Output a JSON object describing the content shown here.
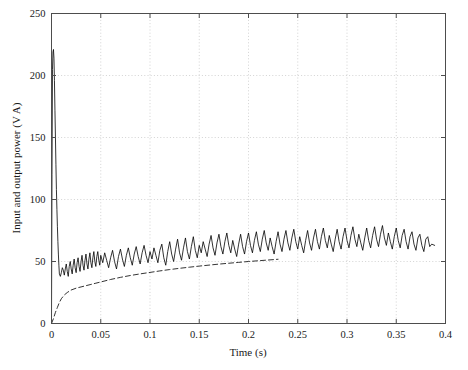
{
  "chart_data": {
    "type": "line",
    "title": "",
    "xlabel": "Time (s)",
    "ylabel": "Input and output power (V A)",
    "xlim": [
      0,
      0.4
    ],
    "ylim": [
      0,
      250
    ],
    "xticks": [
      0,
      0.05,
      0.1,
      0.15,
      0.2,
      0.25,
      0.3,
      0.35,
      0.4
    ],
    "xticklabels": [
      "0",
      "0.05",
      "0.1",
      "0.15",
      "0.2",
      "0.25",
      "0.3",
      "0.35",
      "0.4"
    ],
    "yticks": [
      0,
      50,
      100,
      150,
      200,
      250
    ],
    "yticklabels": [
      "0",
      "50",
      "100",
      "150",
      "200",
      "250"
    ],
    "grid": true,
    "grid_style": "dotted",
    "grid_color": "#c8c8c8",
    "legend": "none",
    "axis_color": "#4d4d4d",
    "background": "#ffffff",
    "series": [
      {
        "name": "Input power",
        "style": "solid",
        "color": "#000000",
        "linewidth": 0.8,
        "description": "Noisy input power: large startup spike to ~220 V A at t=0.002 s, collapses to ~38 V A by t=0.008 s, then noisy band slowly rising from mean ~47 to mean ~65 V A, noise half-amplitude about 8-12 V A, ends at t=0.389 s",
        "x": [
          0,
          0.0005,
          0.001,
          0.0015,
          0.002,
          0.0025,
          0.003,
          0.0035,
          0.004,
          0.0045,
          0.005,
          0.0055,
          0.006,
          0.0065,
          0.007,
          0.0075,
          0.008,
          0.009,
          0.01,
          0.011,
          0.012,
          0.013,
          0.014,
          0.015,
          0.016,
          0.017,
          0.018,
          0.019,
          0.02,
          0.021,
          0.022,
          0.023,
          0.024,
          0.025,
          0.026,
          0.027,
          0.028,
          0.029,
          0.03,
          0.031,
          0.032,
          0.033,
          0.034,
          0.035,
          0.036,
          0.037,
          0.038,
          0.039,
          0.04,
          0.041,
          0.042,
          0.043,
          0.044,
          0.045,
          0.046,
          0.047,
          0.048,
          0.049,
          0.05,
          0.052,
          0.054,
          0.056,
          0.058,
          0.06,
          0.062,
          0.064,
          0.066,
          0.068,
          0.07,
          0.072,
          0.074,
          0.076,
          0.078,
          0.08,
          0.082,
          0.084,
          0.086,
          0.088,
          0.09,
          0.092,
          0.094,
          0.096,
          0.098,
          0.1,
          0.102,
          0.104,
          0.106,
          0.108,
          0.11,
          0.112,
          0.114,
          0.116,
          0.118,
          0.12,
          0.122,
          0.124,
          0.126,
          0.128,
          0.13,
          0.132,
          0.134,
          0.136,
          0.138,
          0.14,
          0.142,
          0.144,
          0.146,
          0.148,
          0.15,
          0.152,
          0.154,
          0.156,
          0.158,
          0.16,
          0.162,
          0.164,
          0.166,
          0.168,
          0.17,
          0.172,
          0.174,
          0.176,
          0.178,
          0.18,
          0.182,
          0.184,
          0.186,
          0.188,
          0.19,
          0.192,
          0.194,
          0.196,
          0.198,
          0.2,
          0.202,
          0.204,
          0.206,
          0.208,
          0.21,
          0.212,
          0.214,
          0.216,
          0.218,
          0.22,
          0.222,
          0.224,
          0.226,
          0.228,
          0.23,
          0.232,
          0.234,
          0.236,
          0.238,
          0.24,
          0.242,
          0.244,
          0.246,
          0.248,
          0.25,
          0.252,
          0.254,
          0.256,
          0.258,
          0.26,
          0.262,
          0.264,
          0.266,
          0.268,
          0.27,
          0.272,
          0.274,
          0.276,
          0.278,
          0.28,
          0.282,
          0.284,
          0.286,
          0.288,
          0.29,
          0.292,
          0.294,
          0.296,
          0.298,
          0.3,
          0.302,
          0.304,
          0.306,
          0.308,
          0.31,
          0.312,
          0.314,
          0.316,
          0.318,
          0.32,
          0.322,
          0.324,
          0.326,
          0.328,
          0.33,
          0.332,
          0.334,
          0.336,
          0.338,
          0.34,
          0.342,
          0.344,
          0.346,
          0.348,
          0.35,
          0.352,
          0.354,
          0.356,
          0.358,
          0.36,
          0.362,
          0.364,
          0.366,
          0.368,
          0.37,
          0.372,
          0.374,
          0.376,
          0.378,
          0.38,
          0.382,
          0.384,
          0.386,
          0.389
        ],
        "y": [
          0,
          120,
          205,
          219,
          221,
          214,
          196,
          172,
          150,
          128,
          108,
          92,
          78,
          66,
          56,
          47,
          40,
          38,
          41,
          45,
          43,
          39,
          44,
          48,
          42,
          38,
          46,
          50,
          44,
          40,
          47,
          52,
          45,
          41,
          49,
          53,
          46,
          42,
          50,
          55,
          47,
          43,
          51,
          56,
          48,
          44,
          52,
          57,
          49,
          45,
          53,
          58,
          50,
          46,
          54,
          58,
          51,
          47,
          55,
          49,
          57,
          51,
          45,
          53,
          59,
          50,
          44,
          54,
          60,
          52,
          46,
          55,
          61,
          53,
          47,
          56,
          62,
          54,
          48,
          57,
          63,
          55,
          49,
          58,
          52,
          61,
          55,
          49,
          59,
          64,
          53,
          47,
          58,
          66,
          56,
          50,
          60,
          68,
          57,
          51,
          61,
          69,
          58,
          52,
          62,
          70,
          59,
          53,
          63,
          57,
          66,
          60,
          54,
          64,
          71,
          61,
          55,
          65,
          72,
          62,
          56,
          66,
          73,
          63,
          57,
          67,
          60,
          54,
          64,
          72,
          62,
          56,
          66,
          73,
          63,
          57,
          67,
          74,
          64,
          58,
          68,
          75,
          65,
          59,
          69,
          62,
          56,
          66,
          74,
          64,
          58,
          68,
          75,
          65,
          59,
          69,
          76,
          66,
          60,
          70,
          63,
          57,
          67,
          75,
          65,
          59,
          69,
          76,
          66,
          60,
          70,
          77,
          67,
          61,
          71,
          64,
          58,
          68,
          76,
          66,
          60,
          70,
          77,
          67,
          61,
          71,
          78,
          68,
          62,
          72,
          65,
          59,
          69,
          77,
          67,
          61,
          71,
          78,
          68,
          62,
          72,
          79,
          69,
          63,
          73,
          66,
          60,
          70,
          77,
          67,
          61,
          71,
          76,
          66,
          60,
          70,
          74,
          64,
          59,
          69,
          72,
          63,
          58,
          68,
          70,
          62,
          64,
          63
        ]
      },
      {
        "name": "Output power",
        "style": "dashed",
        "color": "#000000",
        "linewidth": 0.8,
        "dash_pattern": "5,3",
        "description": "Smooth output power rising from 0 at t=0, steep initial rise to ~20 by t=0.01, asymptotic approach: ~30 at 0.05, ~40 at 0.1, ~47 at 0.15, ~52 at 0.2, merges into the noisy band near t=0.22",
        "x": [
          0,
          0.002,
          0.004,
          0.006,
          0.008,
          0.01,
          0.013,
          0.016,
          0.02,
          0.025,
          0.03,
          0.035,
          0.04,
          0.045,
          0.05,
          0.06,
          0.07,
          0.08,
          0.09,
          0.1,
          0.11,
          0.12,
          0.13,
          0.14,
          0.15,
          0.16,
          0.17,
          0.18,
          0.19,
          0.2,
          0.21,
          0.22,
          0.23
        ],
        "y": [
          0,
          4,
          9,
          13,
          17,
          20,
          23,
          25,
          27,
          28.5,
          29.5,
          30.5,
          31.5,
          32.5,
          33.5,
          35.5,
          37.2,
          38.7,
          40,
          41.2,
          42.4,
          43.5,
          44.5,
          45.4,
          46.3,
          47.1,
          47.9,
          48.6,
          49.3,
          50,
          50.6,
          51.2,
          51.8
        ]
      }
    ]
  }
}
